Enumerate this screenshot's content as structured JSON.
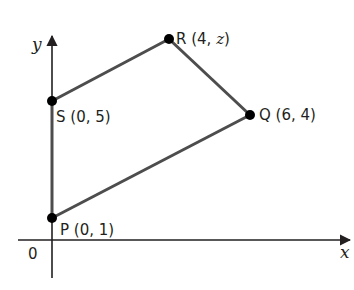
{
  "axes": {
    "x_label": "x",
    "y_label": "y",
    "origin_label": "0"
  },
  "points": [
    {
      "name": "P",
      "coords": "(0, 1)",
      "pre": "P (0, 1)",
      "x": 0,
      "y": 1
    },
    {
      "name": "Q",
      "coords": "(6, 4)",
      "pre": "Q (6, 4)",
      "x": 6,
      "y": 4
    },
    {
      "name": "R",
      "coords_prefix": "R (4, ",
      "coords_var": "z",
      "coords_suffix": ")",
      "x": 4,
      "y": "z"
    },
    {
      "name": "S",
      "coords": "(0, 5)",
      "pre": "S (0, 5)",
      "x": 0,
      "y": 5
    }
  ],
  "shape": {
    "type": "quadrilateral",
    "vertices_order": [
      "P",
      "Q",
      "R",
      "S"
    ]
  },
  "colors": {
    "edge": "#4d4d4d",
    "point": "#000000",
    "axis": "#231f20"
  }
}
